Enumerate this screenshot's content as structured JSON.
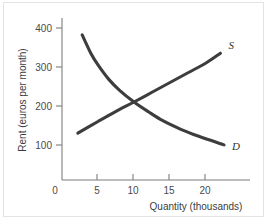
{
  "chart_data": {
    "type": "line",
    "title": "",
    "xlabel": "Quantity (thousands)",
    "ylabel": "Rent (euros per month)",
    "xlim": [
      0,
      24
    ],
    "ylim": [
      0,
      430
    ],
    "xticks": [
      0,
      5,
      10,
      15,
      20
    ],
    "yticks": [
      0,
      100,
      200,
      300,
      400
    ],
    "xtick_labels": [
      "0",
      "5",
      "10",
      "15",
      "20"
    ],
    "ytick_labels": [
      "0",
      "100",
      "200",
      "300",
      "400"
    ],
    "grid": false,
    "legend_position": "inline-curve-end-labels",
    "series": [
      {
        "name": "S",
        "label": "S",
        "description": "Supply curve, upward sloping",
        "color": "#3d3d3d",
        "points": [
          {
            "x": 2.2,
            "y": 120
          },
          {
            "x": 5.0,
            "y": 150
          },
          {
            "x": 7.5,
            "y": 176
          },
          {
            "x": 10.0,
            "y": 200
          },
          {
            "x": 12.5,
            "y": 225
          },
          {
            "x": 15.0,
            "y": 250
          },
          {
            "x": 17.5,
            "y": 275
          },
          {
            "x": 20.0,
            "y": 300
          },
          {
            "x": 22.0,
            "y": 325
          }
        ]
      },
      {
        "name": "D",
        "label": "D",
        "description": "Demand curve, downward sloping and convex to origin",
        "color": "#3d3d3d",
        "points": [
          {
            "x": 2.8,
            "y": 372
          },
          {
            "x": 4.0,
            "y": 325
          },
          {
            "x": 5.0,
            "y": 295
          },
          {
            "x": 6.5,
            "y": 258
          },
          {
            "x": 8.0,
            "y": 230
          },
          {
            "x": 10.0,
            "y": 200
          },
          {
            "x": 12.0,
            "y": 175
          },
          {
            "x": 14.0,
            "y": 152
          },
          {
            "x": 16.5,
            "y": 130
          },
          {
            "x": 19.0,
            "y": 112
          },
          {
            "x": 22.5,
            "y": 90
          }
        ]
      }
    ],
    "annotations": [
      {
        "name": "equilibrium",
        "x": 10,
        "y": 200,
        "text": ""
      }
    ]
  },
  "labels": {
    "y_axis_title": "Rent (euros per month)",
    "x_axis_title": "Quantity (thousands)",
    "supply_curve": "S",
    "demand_curve": "D",
    "ytick_400": "400",
    "ytick_300": "300",
    "ytick_200": "200",
    "ytick_100": "100",
    "origin": "0",
    "xtick_5": "5",
    "xtick_10": "10",
    "xtick_15": "15",
    "xtick_20": "20"
  },
  "colors": {
    "curve": "#3d3d3d",
    "axis": "#7d7d7d",
    "text": "#3c3c3c",
    "background": "#ffffff",
    "frame": "#e3e3e3"
  }
}
